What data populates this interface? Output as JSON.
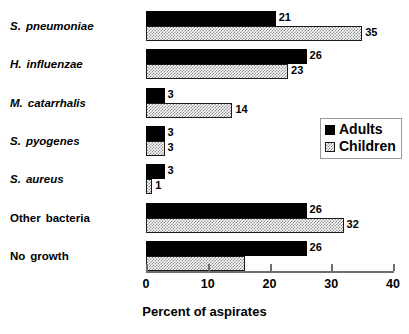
{
  "chart_data": {
    "type": "bar",
    "orientation": "horizontal",
    "title": "",
    "xlabel": "Percent of aspirates",
    "ylabel": "",
    "xlim": [
      0,
      40
    ],
    "xticks": [
      0,
      10,
      20,
      30,
      40
    ],
    "xtick_labels": [
      "0",
      "10",
      "20",
      "30",
      "40"
    ],
    "grid": false,
    "legend_position": "middle-right",
    "categories": [
      "S. pneumoniae",
      "H. influenzae",
      "M. catarrhalis",
      "S. pyogenes",
      "S. aureus",
      "Other bacteria",
      "No growth"
    ],
    "category_styles": [
      "italic",
      "italic",
      "italic",
      "italic",
      "italic",
      "normal",
      "normal"
    ],
    "series": [
      {
        "name": "Adults",
        "color": "#000000",
        "pattern": "solid",
        "values": [
          21,
          26,
          3,
          3,
          3,
          26,
          26
        ],
        "labels": [
          "21",
          "26",
          "3",
          "3",
          "3",
          "26",
          "26"
        ]
      },
      {
        "name": "Children",
        "color": "#8c8c8c",
        "pattern": "checker",
        "values": [
          35,
          23,
          14,
          3,
          1,
          32,
          16
        ],
        "labels": [
          "35",
          "23",
          "14",
          "3",
          "1",
          "32",
          ""
        ]
      }
    ]
  },
  "category_labels": [
    {
      "abbr": "S.",
      "name": "pneumoniae"
    },
    {
      "abbr": "H.",
      "name": "influenzae"
    },
    {
      "abbr": "M.",
      "name": "catarrhalis"
    },
    {
      "abbr": "S.",
      "name": "pyogenes"
    },
    {
      "abbr": "S.",
      "name": "aureus"
    },
    {
      "abbr": "Other",
      "name": "bacteria"
    },
    {
      "abbr": "No",
      "name": "growth"
    }
  ],
  "legend": {
    "items": [
      {
        "label": "Adults"
      },
      {
        "label": "Children"
      }
    ]
  },
  "axis": {
    "title": "Percent of aspirates",
    "ticks": [
      "0",
      "10",
      "20",
      "30",
      "40"
    ]
  }
}
